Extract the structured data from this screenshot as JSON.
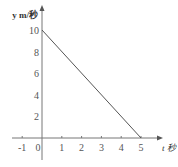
{
  "chart_data": {
    "type": "line",
    "title": "",
    "xlabel": "t 秒",
    "ylabel": "y m/秒",
    "xlim": [
      -1.5,
      5.8
    ],
    "ylim": [
      -2.5,
      11.5
    ],
    "x_ticks": [
      -1,
      0,
      1,
      2,
      3,
      4,
      5
    ],
    "x_tick_labels": [
      "-1",
      "0",
      "1",
      "2",
      "3",
      "4",
      "5"
    ],
    "y_ticks": [
      2,
      4,
      6,
      8,
      10
    ],
    "y_tick_labels": [
      "2",
      "4",
      "6",
      "8",
      "10"
    ],
    "grid": false,
    "series": [
      {
        "name": "y",
        "x": [
          0,
          5
        ],
        "y": [
          10,
          0
        ],
        "color": "#555555"
      }
    ]
  }
}
